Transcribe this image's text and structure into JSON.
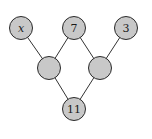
{
  "diagram": {
    "type": "tree",
    "nodes": [
      {
        "id": "n_x",
        "label": "x",
        "italic": true,
        "cx": 21,
        "cy": 28
      },
      {
        "id": "n_7",
        "label": "7",
        "italic": false,
        "cx": 74,
        "cy": 28
      },
      {
        "id": "n_3",
        "label": "3",
        "italic": false,
        "cx": 126,
        "cy": 28
      },
      {
        "id": "n_midleft",
        "label": "",
        "italic": false,
        "cx": 49,
        "cy": 68
      },
      {
        "id": "n_midright",
        "label": "",
        "italic": false,
        "cx": 100,
        "cy": 68
      },
      {
        "id": "n_11",
        "label": "11",
        "italic": false,
        "cx": 74,
        "cy": 109
      }
    ],
    "edges": [
      [
        "n_x",
        "n_midleft"
      ],
      [
        "n_7",
        "n_midleft"
      ],
      [
        "n_7",
        "n_midright"
      ],
      [
        "n_3",
        "n_midright"
      ],
      [
        "n_midleft",
        "n_11"
      ],
      [
        "n_midright",
        "n_11"
      ]
    ],
    "node_radius": 11.5,
    "colors": {
      "node_fill": "#c8c8c8",
      "node_stroke": "#2a2a2a",
      "edge": "#333333"
    }
  }
}
